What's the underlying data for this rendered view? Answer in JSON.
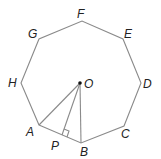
{
  "diagram": {
    "line_color": "#8a8a8a",
    "vertices": {
      "A": {
        "label": "A",
        "x": 39,
        "y": 125
      },
      "B": {
        "label": "B",
        "x": 81,
        "y": 143
      },
      "C": {
        "label": "C",
        "x": 124,
        "y": 126
      },
      "D": {
        "label": "D",
        "x": 141,
        "y": 83
      },
      "E": {
        "label": "E",
        "x": 123,
        "y": 39
      },
      "F": {
        "label": "F",
        "x": 82,
        "y": 21
      },
      "G": {
        "label": "G",
        "x": 39,
        "y": 39
      },
      "H": {
        "label": "H",
        "x": 21,
        "y": 83
      }
    },
    "center": {
      "label": "O",
      "x": 80,
      "y": 83
    },
    "foot": {
      "label": "P",
      "x": 62,
      "y": 135
    },
    "segments": [
      "OA",
      "OB",
      "OP"
    ],
    "right_angle_at": "P"
  }
}
